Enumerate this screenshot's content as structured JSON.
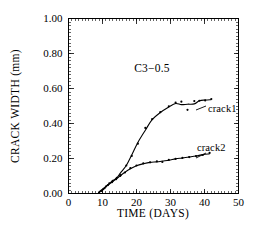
{
  "chart_data": {
    "type": "line",
    "title": "",
    "annotation": "C3−0.5",
    "xlabel": "TIME  (DAYS)",
    "ylabel": "CRACK WIDTH  (mm)",
    "xlim": [
      0,
      50
    ],
    "ylim": [
      0.0,
      1.0
    ],
    "xticks": [
      0,
      10,
      20,
      30,
      40,
      50
    ],
    "xtick_labels": [
      "0",
      "10",
      "20",
      "30",
      "40",
      "50"
    ],
    "yticks": [
      0.0,
      0.2,
      0.4,
      0.6,
      0.8,
      1.0
    ],
    "ytick_labels": [
      "0.00",
      "0.20",
      "0.40",
      "0.60",
      "0.80",
      "1.00"
    ],
    "x_minor_step": 1,
    "y_minor_step": 0.02,
    "grid": false,
    "legend": "inline-labels",
    "frame": "box",
    "series": [
      {
        "name": "crack1",
        "label": "crack1",
        "marker": "dot",
        "points": [
          {
            "x": 9.0,
            "y": 0.005
          },
          {
            "x": 9.6,
            "y": 0.015
          },
          {
            "x": 10.2,
            "y": 0.025
          },
          {
            "x": 11.0,
            "y": 0.04
          },
          {
            "x": 12.0,
            "y": 0.058
          },
          {
            "x": 13.0,
            "y": 0.072
          },
          {
            "x": 14.2,
            "y": 0.09
          },
          {
            "x": 15.3,
            "y": 0.105
          },
          {
            "x": 17.0,
            "y": 0.16
          },
          {
            "x": 18.6,
            "y": 0.215
          },
          {
            "x": 20.4,
            "y": 0.285
          },
          {
            "x": 22.6,
            "y": 0.375
          },
          {
            "x": 24.6,
            "y": 0.425
          },
          {
            "x": 27.0,
            "y": 0.465
          },
          {
            "x": 29.5,
            "y": 0.498
          },
          {
            "x": 31.5,
            "y": 0.52
          },
          {
            "x": 33.2,
            "y": 0.525
          },
          {
            "x": 35.0,
            "y": 0.478
          },
          {
            "x": 37.0,
            "y": 0.528
          },
          {
            "x": 38.5,
            "y": 0.53
          },
          {
            "x": 40.2,
            "y": 0.532
          },
          {
            "x": 42.0,
            "y": 0.54
          }
        ]
      },
      {
        "name": "crack2",
        "label": "crack2",
        "marker": "dot",
        "points": [
          {
            "x": 9.0,
            "y": 0.005
          },
          {
            "x": 9.8,
            "y": 0.018
          },
          {
            "x": 10.6,
            "y": 0.03
          },
          {
            "x": 11.6,
            "y": 0.048
          },
          {
            "x": 12.8,
            "y": 0.065
          },
          {
            "x": 14.0,
            "y": 0.082
          },
          {
            "x": 15.2,
            "y": 0.1
          },
          {
            "x": 16.6,
            "y": 0.12
          },
          {
            "x": 18.2,
            "y": 0.145
          },
          {
            "x": 20.0,
            "y": 0.16
          },
          {
            "x": 22.0,
            "y": 0.172
          },
          {
            "x": 24.0,
            "y": 0.178
          },
          {
            "x": 26.0,
            "y": 0.184
          },
          {
            "x": 27.6,
            "y": 0.18
          },
          {
            "x": 29.5,
            "y": 0.192
          },
          {
            "x": 31.5,
            "y": 0.198
          },
          {
            "x": 33.5,
            "y": 0.203
          },
          {
            "x": 35.5,
            "y": 0.208
          },
          {
            "x": 37.5,
            "y": 0.214
          },
          {
            "x": 39.5,
            "y": 0.22
          },
          {
            "x": 41.5,
            "y": 0.232
          }
        ]
      }
    ]
  }
}
